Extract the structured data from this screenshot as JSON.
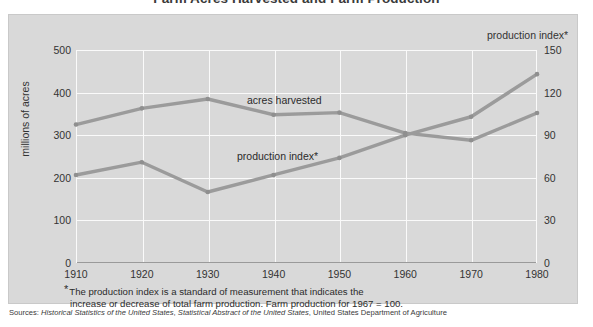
{
  "title": "Farm Acres Harvested and Farm Production",
  "axes": {
    "left_label": "millions of acres",
    "right_label": "production index*",
    "left_ticks": [
      "500",
      "400",
      "300",
      "200",
      "100",
      "0"
    ],
    "right_ticks": [
      "150",
      "120",
      "90",
      "60",
      "30",
      "0"
    ],
    "bottom_ticks": [
      "1910",
      "1920",
      "1930",
      "1940",
      "1950",
      "1960",
      "1970",
      "1980"
    ]
  },
  "series_labels": {
    "acres": "acres harvested",
    "production": "production index*"
  },
  "footnote": {
    "star": "*",
    "line1": "The production index is a standard of measurement that indicates the",
    "line2": "increase or decrease of total farm production. Farm production for 1967  =  100."
  },
  "sources": {
    "prefix": "Sources: ",
    "item1": "Historical Statistics of the United States",
    "sep1": ", ",
    "item2": "Statistical Abstract of the United States",
    "sep2": ", ",
    "item3": "United States Department of Agriculture"
  },
  "colors": {
    "panel_background": "#d9d9d9",
    "gridline": "#fafafa",
    "series_line": "#9b9b9b",
    "axis": "#9a9a9a",
    "text": "#2b2b2b"
  },
  "chart_data": {
    "type": "line",
    "title": "Farm Acres Harvested and Farm Production",
    "xlabel": "",
    "ylabel": "millions of acres",
    "y2label": "production index*",
    "x": [
      1910,
      1920,
      1930,
      1940,
      1950,
      1960,
      1970,
      1980
    ],
    "categories": [
      "1910",
      "1920",
      "1930",
      "1940",
      "1950",
      "1960",
      "1970",
      "1980"
    ],
    "ylim": [
      0,
      500
    ],
    "y2lim": [
      0,
      150
    ],
    "yticks": [
      0,
      100,
      200,
      300,
      400,
      500
    ],
    "y2ticks": [
      0,
      30,
      60,
      90,
      120,
      150
    ],
    "grid": true,
    "legend": "in-plot labels",
    "series": [
      {
        "name": "acres harvested",
        "axis": "left",
        "units": "millions of acres",
        "values": [
          325,
          363,
          385,
          348,
          353,
          305,
          288,
          352
        ]
      },
      {
        "name": "production index*",
        "axis": "right",
        "units": "index, 1967 = 100",
        "values": [
          62,
          71,
          50,
          62,
          74,
          90,
          103,
          133
        ],
        "values_in_left_axis_scale": [
          207,
          237,
          167,
          207,
          247,
          300,
          343,
          443
        ]
      }
    ],
    "annotations": [
      "acres harvested",
      "production index*",
      "*The production index is a standard of measurement that indicates the increase or decrease of total farm production. Farm production for 1967 = 100."
    ]
  }
}
